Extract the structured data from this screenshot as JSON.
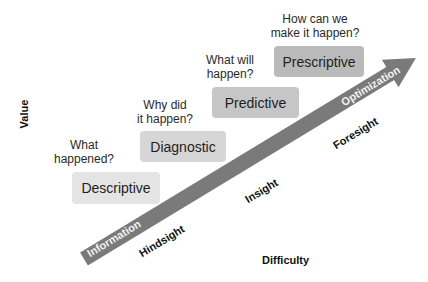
{
  "axes": {
    "y_label": "Value",
    "x_label": "Difficulty"
  },
  "arrow": {
    "start_label": "Information",
    "end_label": "Optimization",
    "color": "#7a7a7a"
  },
  "stages": [
    {
      "question_line1": "What",
      "question_line2": "happened?",
      "label": "Descriptive",
      "color": "#e4e4e4"
    },
    {
      "question_line1": "Why did",
      "question_line2": "it happen?",
      "label": "Diagnostic",
      "color": "#d6d6d6"
    },
    {
      "question_line1": "What will",
      "question_line2": "happen?",
      "label": "Predictive",
      "color": "#c6c6c6"
    },
    {
      "question_line1": "How can we",
      "question_line2": "make it happen?",
      "label": "Prescriptive",
      "color": "#bababa"
    }
  ],
  "sights": [
    {
      "label": "Hindsight"
    },
    {
      "label": "Insight"
    },
    {
      "label": "Foresight"
    }
  ]
}
